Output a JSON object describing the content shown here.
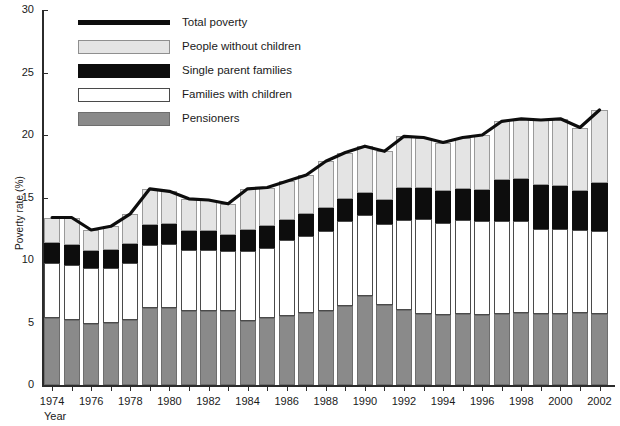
{
  "chart_data": {
    "type": "bar",
    "subtype": "stacked-bar-with-line",
    "title": "",
    "xlabel": "Year",
    "ylabel": "Poverty rate (%)",
    "ylim": [
      0,
      30
    ],
    "ytick_values": [
      0,
      5,
      10,
      15,
      20,
      25,
      30
    ],
    "ytick_labels": [
      "0",
      "5",
      "10",
      "15",
      "20",
      "25",
      "30"
    ],
    "grid": false,
    "legend_position": "top-left",
    "x": [
      1974,
      1975,
      1976,
      1977,
      1978,
      1979,
      1980,
      1981,
      1982,
      1983,
      1984,
      1985,
      1986,
      1987,
      1988,
      1989,
      1990,
      1991,
      1992,
      1993,
      1994,
      1995,
      1996,
      1997,
      1998,
      1999,
      2000,
      2001,
      2002
    ],
    "xtick_labels": [
      "1974",
      "1976",
      "1978",
      "1980",
      "1982",
      "1984",
      "1986",
      "1988",
      "1990",
      "1992",
      "1994",
      "1996",
      "1998",
      "2000",
      "2002"
    ],
    "xtick_values": [
      1974,
      1976,
      1978,
      1980,
      1982,
      1984,
      1986,
      1988,
      1990,
      1992,
      1994,
      1996,
      1998,
      2000,
      2002
    ],
    "series": [
      {
        "name": "Pensioners",
        "color": "#8a8a8a",
        "values": [
          5.4,
          5.2,
          4.9,
          5.0,
          5.2,
          6.2,
          6.2,
          5.9,
          5.9,
          5.9,
          5.1,
          5.4,
          5.5,
          5.8,
          5.9,
          6.3,
          7.1,
          6.4,
          6.0,
          5.7,
          5.6,
          5.7,
          5.6,
          5.7,
          5.8,
          5.7,
          5.7,
          5.8,
          5.7
        ]
      },
      {
        "name": "Families with children",
        "color": "#ffffff",
        "values": [
          4.4,
          4.4,
          4.5,
          4.4,
          4.6,
          5.0,
          5.1,
          4.9,
          4.9,
          4.8,
          5.6,
          5.6,
          6.1,
          6.1,
          6.4,
          6.8,
          6.5,
          6.5,
          7.2,
          7.6,
          7.4,
          7.5,
          7.5,
          7.4,
          7.3,
          6.8,
          6.8,
          6.6,
          6.6
        ]
      },
      {
        "name": "Single parent families",
        "color": "#0d0d0d",
        "values": [
          1.6,
          1.6,
          1.3,
          1.4,
          1.5,
          1.6,
          1.6,
          1.5,
          1.5,
          1.3,
          1.7,
          1.7,
          1.6,
          1.8,
          1.9,
          1.8,
          1.8,
          1.9,
          2.6,
          2.5,
          2.5,
          2.5,
          2.5,
          3.3,
          3.4,
          3.5,
          3.4,
          3.1,
          3.9
        ]
      },
      {
        "name": "People without children",
        "color": "#e4e4e4",
        "values": [
          2.0,
          2.2,
          1.7,
          1.9,
          2.4,
          2.9,
          2.6,
          2.6,
          2.5,
          2.5,
          3.3,
          3.1,
          3.1,
          3.1,
          3.7,
          3.7,
          3.7,
          3.9,
          4.1,
          4.0,
          3.9,
          4.1,
          4.4,
          4.7,
          4.8,
          5.2,
          5.4,
          5.1,
          5.8
        ]
      }
    ],
    "line_series": {
      "name": "Total poverty",
      "color": "#0d0d0d",
      "values": [
        13.4,
        13.4,
        12.4,
        12.7,
        13.7,
        15.7,
        15.5,
        14.9,
        14.8,
        14.5,
        15.7,
        15.8,
        16.3,
        16.8,
        17.9,
        18.6,
        19.1,
        18.7,
        19.9,
        19.8,
        19.4,
        19.8,
        20.0,
        21.1,
        21.3,
        21.2,
        21.3,
        20.6,
        22.0
      ]
    },
    "legend": [
      {
        "key": "line",
        "label": "Total poverty"
      },
      {
        "key": "nochild",
        "label": "People without children"
      },
      {
        "key": "single",
        "label": "Single parent families"
      },
      {
        "key": "families",
        "label": "Families with children"
      },
      {
        "key": "pensioners",
        "label": "Pensioners"
      }
    ]
  }
}
